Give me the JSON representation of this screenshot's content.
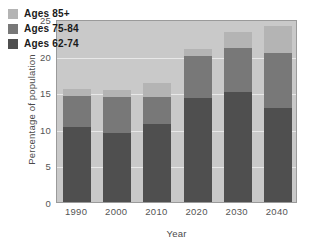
{
  "chart_data": {
    "type": "bar",
    "stacked": true,
    "title": "",
    "xlabel": "Year",
    "ylabel": "Percentage of population",
    "categories": [
      "1990",
      "2000",
      "2010",
      "2020",
      "2030",
      "2040"
    ],
    "yticks": [
      "0",
      "5",
      "10",
      "15",
      "20",
      "25"
    ],
    "ylim": [
      0,
      25
    ],
    "grid": true,
    "legend_position": "top-left inside plot",
    "series": [
      {
        "name": "Ages 62-74",
        "color": "#4f4f4f",
        "values": [
          10.2,
          9.4,
          10.6,
          14.2,
          15.0,
          12.8
        ]
      },
      {
        "name": "Ages 75-84",
        "color": "#787878",
        "values": [
          4.3,
          5.0,
          3.7,
          5.7,
          6.0,
          7.6
        ]
      },
      {
        "name": "Ages 85+",
        "color": "#b4b4b4",
        "values": [
          0.9,
          0.9,
          2.0,
          1.0,
          2.2,
          3.6
        ]
      }
    ],
    "totals": [
      15.4,
      15.3,
      16.3,
      19.9,
      23.2,
      24.0
    ]
  },
  "legend": {
    "entries": [
      {
        "label": "Ages 85+",
        "color": "#b4b4b4"
      },
      {
        "label": "Ages 75-84",
        "color": "#787878"
      },
      {
        "label": "Ages 62-74",
        "color": "#4f4f4f"
      }
    ]
  },
  "axes": {
    "x_title": "Year",
    "y_title": "Percentage of population",
    "y_ticks": [
      "25",
      "20",
      "15",
      "10",
      "5",
      "0"
    ],
    "x_ticks": [
      "1990",
      "2000",
      "2010",
      "2020",
      "2030",
      "2040"
    ]
  },
  "colors": {
    "plot_background": "#c9c9c9",
    "gridline": "#e8e8e8",
    "frame": "#9a9a9a",
    "tick_text": "#555555",
    "legend_text": "#1a1a1a"
  }
}
